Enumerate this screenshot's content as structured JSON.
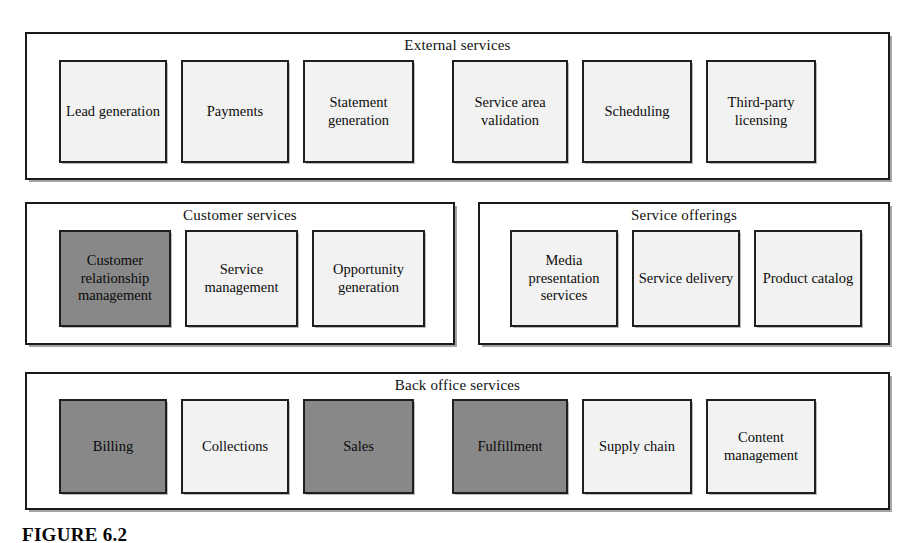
{
  "figure": {
    "caption": "FIGURE 6.2",
    "colors": {
      "light_fill": "#f2f2f2",
      "dark_fill": "#888888",
      "border": "#1f1f1f",
      "page_background": "#ffffff"
    }
  },
  "groups": [
    {
      "id": "external-services",
      "title": "External services",
      "boxes": [
        {
          "label": "Lead generation",
          "shade": "light"
        },
        {
          "label": "Payments",
          "shade": "light"
        },
        {
          "label": "Statement generation",
          "shade": "light"
        },
        {
          "label": "Service area validation",
          "shade": "light"
        },
        {
          "label": "Scheduling",
          "shade": "light"
        },
        {
          "label": "Third-party licensing",
          "shade": "light"
        }
      ]
    },
    {
      "id": "customer-services",
      "title": "Customer services",
      "boxes": [
        {
          "label": "Customer relationship management",
          "shade": "dark"
        },
        {
          "label": "Service management",
          "shade": "light"
        },
        {
          "label": "Opportunity generation",
          "shade": "light"
        }
      ]
    },
    {
      "id": "service-offerings",
      "title": "Service offerings",
      "boxes": [
        {
          "label": "Media presentation services",
          "shade": "light"
        },
        {
          "label": "Service delivery",
          "shade": "light"
        },
        {
          "label": "Product catalog",
          "shade": "light"
        }
      ]
    },
    {
      "id": "back-office-services",
      "title": "Back office services",
      "boxes": [
        {
          "label": "Billing",
          "shade": "dark"
        },
        {
          "label": "Collections",
          "shade": "light"
        },
        {
          "label": "Sales",
          "shade": "dark"
        },
        {
          "label": "Fulfillment",
          "shade": "dark"
        },
        {
          "label": "Supply chain",
          "shade": "light"
        },
        {
          "label": "Content management",
          "shade": "light"
        }
      ]
    }
  ]
}
